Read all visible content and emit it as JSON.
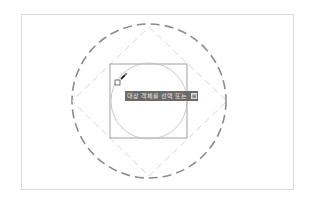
{
  "viewport": {
    "background": "#ffffff",
    "border_color": "#d8d8d8"
  },
  "drawing": {
    "outer_circle": {
      "cx": 149,
      "cy": 101,
      "r": 77,
      "style": "dashed",
      "color": "#8c8c8c"
    },
    "diamond": {
      "points": [
        [
          149,
          27
        ],
        [
          227,
          101
        ],
        [
          149,
          176
        ],
        [
          72,
          101
        ]
      ],
      "style": "dashed",
      "color": "#cfcfcf"
    },
    "square": {
      "x": 110,
      "y": 64,
      "w": 77,
      "h": 74,
      "color": "#8a8a8a"
    },
    "inner_circle": {
      "cx": 149,
      "cy": 101,
      "r": 38,
      "color": "#bcbcbc"
    }
  },
  "cursor": {
    "pickbox_x": 115,
    "pickbox_y": 80,
    "icon": "pencil-pick-icon"
  },
  "tooltip": {
    "text": "대상 객체를 선택 또는",
    "expand_icon": "⊞",
    "background": "#6a6a6a"
  }
}
